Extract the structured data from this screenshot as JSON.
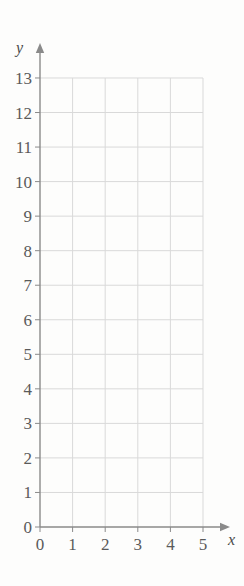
{
  "chart_data": {
    "type": "scatter",
    "title": "",
    "subtitle": "",
    "xlabel": "x",
    "ylabel": "y",
    "xlim": [
      0,
      5
    ],
    "ylim": [
      0,
      13
    ],
    "xticks": [
      "0",
      "1",
      "2",
      "3",
      "4",
      "5"
    ],
    "yticks": [
      "0",
      "1",
      "2",
      "3",
      "4",
      "5",
      "6",
      "7",
      "8",
      "9",
      "10",
      "11",
      "12",
      "13"
    ],
    "xtick_step": 1,
    "ytick_step": 1,
    "grid": true,
    "legend": null,
    "series": [],
    "annotations": []
  },
  "style": {
    "background_color": "#fdfdfc",
    "grid_color": "#d9d9d9",
    "axis_color": "#8a8a8a",
    "label_color": "#5a5a5a",
    "axis_name_color": "#4a4a4a"
  },
  "geometry": {
    "origin_x": 40,
    "origin_y": 527,
    "x_step_px": 32.6,
    "y_step_px": 34.54,
    "x_axis_arrow_end": 230,
    "y_axis_arrow_end": 43
  }
}
